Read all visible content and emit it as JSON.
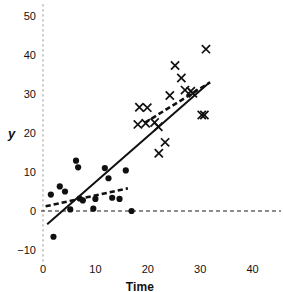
{
  "chart_data": {
    "type": "scatter",
    "title": "",
    "xlabel": "Time",
    "ylabel": "y",
    "xlim": [
      0,
      42.5
    ],
    "ylim": [
      -12,
      52
    ],
    "xticks": [
      0,
      10,
      20,
      30,
      40
    ],
    "xtick_labels": [
      "0",
      "10",
      "20",
      "30",
      "40"
    ],
    "yticks": [
      -10,
      0,
      10,
      20,
      30,
      40,
      50
    ],
    "ytick_labels": [
      "−10",
      "0",
      "10",
      "20",
      "30",
      "40",
      "50"
    ],
    "grid": false,
    "legend": "none",
    "axis_style": {
      "y_axis_line": "dashed-gray-vertical-at-x0",
      "zero_line": "dashed-black-horizontal-at-y0",
      "frame": "none",
      "ticks": "none"
    },
    "series": [
      {
        "name": "group-circles",
        "marker": "filled-circle",
        "color": "#101010",
        "points": [
          [
            1.5,
            4.2
          ],
          [
            2.0,
            -6.6
          ],
          [
            3.2,
            6.3
          ],
          [
            4.2,
            5.0
          ],
          [
            5.2,
            0.4
          ],
          [
            6.3,
            12.9
          ],
          [
            6.7,
            11.2
          ],
          [
            7.0,
            3.2
          ],
          [
            7.6,
            2.7
          ],
          [
            9.6,
            0.6
          ],
          [
            10.0,
            3.1
          ],
          [
            11.8,
            11.0
          ],
          [
            12.5,
            8.4
          ],
          [
            13.2,
            3.4
          ],
          [
            14.6,
            3.1
          ],
          [
            15.8,
            10.4
          ],
          [
            16.9,
            0.0
          ]
        ]
      },
      {
        "name": "group-crosses",
        "marker": "x-cross",
        "color": "#101010",
        "points": [
          [
            18.1,
            22.2
          ],
          [
            18.4,
            26.6
          ],
          [
            19.6,
            22.5
          ],
          [
            19.9,
            26.5
          ],
          [
            21.3,
            22.7
          ],
          [
            22.0,
            21.6
          ],
          [
            22.1,
            14.8
          ],
          [
            23.3,
            17.6
          ],
          [
            24.2,
            29.6
          ],
          [
            25.2,
            37.3
          ],
          [
            26.4,
            34.1
          ],
          [
            27.1,
            31.0
          ],
          [
            28.2,
            30.7
          ],
          [
            28.6,
            30.2
          ],
          [
            30.3,
            24.6
          ],
          [
            30.8,
            24.6
          ],
          [
            31.1,
            41.5
          ]
        ]
      }
    ],
    "lines": [
      {
        "name": "overall-regression-solid",
        "style": "solid",
        "width": 2.0,
        "color": "#101010",
        "from": [
          0.8,
          -3.4
        ],
        "to": [
          31.8,
          33.0
        ]
      },
      {
        "name": "circles-group-regression-dashed",
        "style": "dashed",
        "width": 2.6,
        "color": "#101010",
        "from": [
          0.5,
          1.2
        ],
        "to": [
          16.2,
          5.8
        ]
      },
      {
        "name": "crosses-group-regression-dashed",
        "style": "dashed",
        "width": 2.6,
        "color": "#101010",
        "from": [
          19.4,
          22.6
        ],
        "to": [
          31.9,
          33.0
        ]
      }
    ]
  },
  "axes": {
    "y_title": "y",
    "x_title": "Time"
  }
}
